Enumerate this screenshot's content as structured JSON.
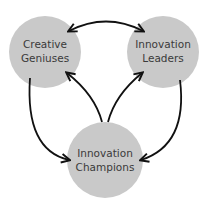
{
  "nodes": [
    {
      "id": "creative-geniuses",
      "lines": [
        "Creative",
        "Geniuses"
      ]
    },
    {
      "id": "innovation-leaders",
      "lines": [
        "Innovation",
        "Leaders"
      ]
    },
    {
      "id": "innovation-champions",
      "lines": [
        "Innovation",
        "Champions"
      ]
    }
  ],
  "edges": [
    {
      "from": "creative-geniuses",
      "to": "innovation-leaders",
      "bidirectional": true
    },
    {
      "from": "creative-geniuses",
      "to": "innovation-champions",
      "bidirectional": false
    },
    {
      "from": "innovation-champions",
      "to": "creative-geniuses",
      "bidirectional": false
    },
    {
      "from": "innovation-champions",
      "to": "innovation-leaders",
      "bidirectional": false
    },
    {
      "from": "innovation-leaders",
      "to": "innovation-champions",
      "bidirectional": false
    }
  ],
  "colors": {
    "node_fill": "#c9c9c9",
    "arrow": "#111111",
    "text": "#3a3a3a"
  }
}
